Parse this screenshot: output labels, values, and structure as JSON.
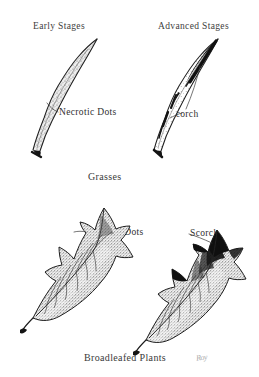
{
  "figure": {
    "background_color": "#ffffff",
    "ink_color": "#1a1a1a",
    "text_color": "#3a3a3a",
    "signature": "Roy"
  },
  "headings": {
    "early": "Early Stages",
    "advanced": "Advanced Stages"
  },
  "sections": [
    {
      "id": "grasses",
      "title": "Grasses"
    },
    {
      "id": "broadleafed",
      "title": "Broadleafed Plants"
    }
  ],
  "callouts": {
    "grass_necrotic": "Necrotic Dots",
    "grass_scorch": "Scorch",
    "leaf_necrotic": "Necrotic Dots",
    "leaf_scorch": "Scorch"
  },
  "specimens": [
    {
      "name": "grass-blade-early",
      "section": "grasses",
      "stage": "Early Stages",
      "symptom": "Necrotic Dots",
      "rendering": "stippled sinuous blade, uniform fine speckling, dark base sheath"
    },
    {
      "name": "grass-blade-advanced",
      "section": "grasses",
      "stage": "Advanced Stages",
      "symptom": "Scorch",
      "rendering": "sinuous blade with solid black scorched tip and black marginal patches"
    },
    {
      "name": "broadleaf-early",
      "section": "broadleafed",
      "stage": "Early Stages",
      "symptom": "Necrotic Dots",
      "rendering": "lobed serrate leaf, dense stipple across lamina, pinnate venation"
    },
    {
      "name": "broadleaf-advanced",
      "section": "broadleafed",
      "stage": "Advanced Stages",
      "symptom": "Scorch",
      "rendering": "lobed serrate leaf with solid black scorched apex and blackened lobe sinuses"
    }
  ]
}
